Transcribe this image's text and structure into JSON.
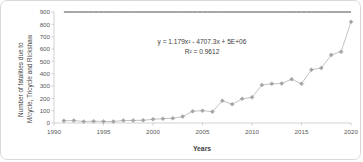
{
  "chart_data": {
    "type": "scatter",
    "title": "",
    "xlabel": "Years",
    "ylabel": "Number of fatalities due to M/cycle, Tricycle and Rickshaw",
    "ylabel_line1": "Number of fatalities due to",
    "ylabel_line2": "M/cycle, Tricycle and Rickshaw",
    "xlim": [
      1990,
      2020
    ],
    "ylim": [
      0,
      900
    ],
    "xticks": [
      1990,
      1995,
      2000,
      2005,
      2010,
      2015,
      2020
    ],
    "yticks": [
      0,
      100,
      200,
      300,
      400,
      500,
      600,
      700,
      800,
      900
    ],
    "grid": false,
    "legend": "none",
    "marker_color": "#a6a6a6",
    "line_color": "#b3b3b3",
    "trendline_color": "#3a3a3a",
    "annotations": {
      "equation": "y = 1.179x² - 4707.3x + 5E+06",
      "r_squared": "R² = 0.9612"
    },
    "x": [
      1991,
      1992,
      1993,
      1994,
      1995,
      1996,
      1997,
      1998,
      1999,
      2000,
      2001,
      2002,
      2003,
      2004,
      2005,
      2006,
      2007,
      2008,
      2009,
      2010,
      2011,
      2012,
      2013,
      2014,
      2015,
      2016,
      2017,
      2018,
      2019,
      2020
    ],
    "values": [
      18,
      20,
      12,
      14,
      13,
      12,
      20,
      21,
      22,
      30,
      35,
      38,
      52,
      95,
      100,
      92,
      180,
      152,
      196,
      208,
      308,
      318,
      320,
      355,
      318,
      432,
      446,
      552,
      578,
      820
    ],
    "series": [
      {
        "name": "Number of fatalities due to M/cycle, Tricycle and Rickshaw",
        "values": [
          18,
          20,
          12,
          14,
          13,
          12,
          20,
          21,
          22,
          30,
          35,
          38,
          52,
          95,
          100,
          92,
          180,
          152,
          196,
          208,
          308,
          318,
          320,
          355,
          318,
          432,
          446,
          552,
          578,
          820
        ]
      }
    ],
    "trendline": {
      "type": "polynomial",
      "order": 2,
      "equation": "y = 1.179x² - 4707.3x + 5E+06",
      "coefficients": {
        "a": 1.179,
        "b": -4707.3,
        "c": 5000000
      },
      "r_squared": 0.9612
    }
  }
}
